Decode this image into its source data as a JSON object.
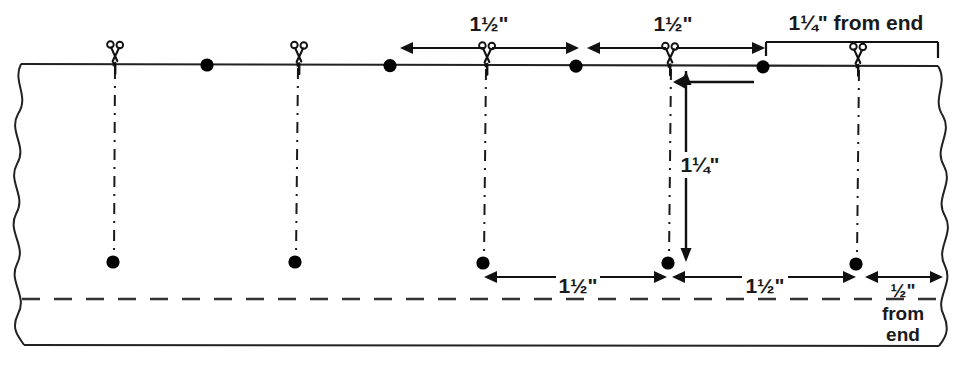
{
  "diagram": {
    "edges": {
      "left_edge_style": "wavy-break",
      "right_edge_style": "wavy-break",
      "top_edge_style": "solid",
      "bottom_edge_style": "solid",
      "fold_line_style": "dashed"
    },
    "colors": {
      "line": "#1a1a1a",
      "background": "#ffffff",
      "marker": "#000000"
    },
    "cut_marks": [
      {
        "name": "cut-mark-1",
        "x": 115,
        "icon": "scissors-icon"
      },
      {
        "name": "cut-mark-2",
        "x": 299,
        "icon": "scissors-icon"
      },
      {
        "name": "cut-mark-3",
        "x": 487,
        "icon": "scissors-icon"
      },
      {
        "name": "cut-mark-4",
        "x": 670,
        "icon": "scissors-icon"
      },
      {
        "name": "cut-mark-5",
        "x": 858,
        "icon": "scissors-icon"
      }
    ],
    "top_dots": [
      {
        "name": "top-dot-1",
        "x": 207
      },
      {
        "name": "top-dot-2",
        "x": 390
      },
      {
        "name": "top-dot-3",
        "x": 576
      },
      {
        "name": "top-dot-4",
        "x": 763
      }
    ],
    "bottom_dots": [
      {
        "name": "bottom-dot-1",
        "x": 113
      },
      {
        "name": "bottom-dot-2",
        "x": 295
      },
      {
        "name": "bottom-dot-3",
        "x": 483
      },
      {
        "name": "bottom-dot-4",
        "x": 668
      },
      {
        "name": "bottom-dot-5",
        "x": 856
      }
    ],
    "guide_lines": [
      {
        "name": "guide-line-1",
        "x": 115
      },
      {
        "name": "guide-line-2",
        "x": 297
      },
      {
        "name": "guide-line-3",
        "x": 485
      },
      {
        "name": "guide-line-4",
        "x": 670
      },
      {
        "name": "guide-line-5",
        "x": 857
      }
    ],
    "dimensions": {
      "top_span_1": {
        "label": "1½\"",
        "whole": "1",
        "fraction": "½",
        "unit": "\"",
        "x1": 400,
        "x2": 578,
        "y": 48
      },
      "top_span_2": {
        "label": "1½\"",
        "whole": "1",
        "fraction": "½",
        "unit": "\"",
        "x1": 588,
        "x2": 763,
        "y": 48
      },
      "top_end": {
        "label": "1¼\" from end",
        "whole": "1",
        "fraction": "¼",
        "unit": "\" from end",
        "x1": 765,
        "x2": 940,
        "y": 40
      },
      "vertical_center": {
        "label": "1¼\"",
        "whole": "1",
        "fraction": "¼",
        "unit": "\"",
        "x": 686,
        "y1": 70,
        "y2": 262
      },
      "bottom_span_1": {
        "label": "1½\"",
        "whole": "1",
        "fraction": "½",
        "unit": "\"",
        "x1": 485,
        "x2": 666,
        "y": 277
      },
      "bottom_span_2": {
        "label": "1½\"",
        "whole": "1",
        "fraction": "½",
        "unit": "\"",
        "x1": 673,
        "x2": 854,
        "y": 277
      },
      "bottom_end": {
        "label": "½\" from end",
        "fraction": "½",
        "unit": "\"",
        "line2": "from",
        "line3": "end",
        "x1": 866,
        "x2": 938,
        "y": 277
      }
    }
  }
}
